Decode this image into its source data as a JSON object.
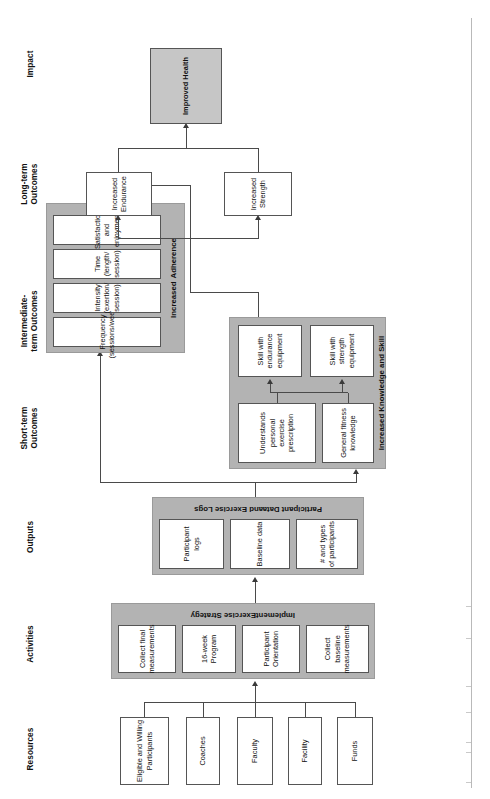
{
  "diagram": {
    "orientation": "rotated-90-ccw",
    "colors": {
      "group_fill": "#b3b3b3",
      "impact_fill": "#c6c6c6",
      "node_fill": "#ffffff",
      "line": "#4a4a4a",
      "text": "#111111"
    }
  },
  "columns": [
    {
      "id": "resources",
      "label": "Resources"
    },
    {
      "id": "activities",
      "label": "Activities"
    },
    {
      "id": "outputs",
      "label": "Outputs"
    },
    {
      "id": "short_term",
      "label": "Short-term\nOutcomes",
      "line1": "Short-term",
      "line2": "Outcomes"
    },
    {
      "id": "intermediate",
      "label": "Intermediate-\nterm Outcomes",
      "line1": "Intermediate-",
      "line2": "term Outcomes"
    },
    {
      "id": "long_term",
      "label": "Long-term\nOutcomes",
      "line1": "Long-term",
      "line2": "Outcomes"
    },
    {
      "id": "impact",
      "label": "Impact"
    }
  ],
  "resources": {
    "items": [
      {
        "label": "Funds"
      },
      {
        "label": "Facility"
      },
      {
        "label": "Faculty"
      },
      {
        "label": "Coaches"
      },
      {
        "label": "Eligible and Willing Participants"
      }
    ]
  },
  "activities": {
    "group_label_line1": "Implement",
    "group_label_line2": "Exercise Strategy",
    "items": [
      {
        "label": "Collect baseline measurements"
      },
      {
        "label": "Participant Orientation"
      },
      {
        "label": "16-week Program"
      },
      {
        "label": "Collect final measurements"
      }
    ]
  },
  "outputs": {
    "group_label_line1": "Participant Data",
    "group_label_line2": "and Exercise Logs",
    "items": [
      {
        "label": "# and types of participants"
      },
      {
        "label": "Baseline data"
      },
      {
        "label": "Participant logs"
      }
    ]
  },
  "knowledge_group": {
    "group_label": "Increased Knowledge and Skill",
    "short_term_items": [
      {
        "label": "General fitness knowledge"
      },
      {
        "label": "Understands personal exercise prescription"
      }
    ],
    "intermediate_items": [
      {
        "label": "Skill with strength equipment"
      },
      {
        "label": "Skill with endurance equipment"
      }
    ]
  },
  "adherence_group": {
    "group_label_line1": "Increased",
    "group_label_line2": "Adherence",
    "items": [
      {
        "label": "Frequency (sessions/week)"
      },
      {
        "label": "Intensity (exertion/ session)"
      },
      {
        "label": "Time (length/ session)"
      },
      {
        "label": "Satisfaction and enjoyment"
      }
    ]
  },
  "long_term": {
    "items": [
      {
        "label": "Increased Strength"
      },
      {
        "label": "Increased Endurance"
      }
    ]
  },
  "impact": {
    "items": [
      {
        "label": "Improved Health"
      }
    ]
  }
}
